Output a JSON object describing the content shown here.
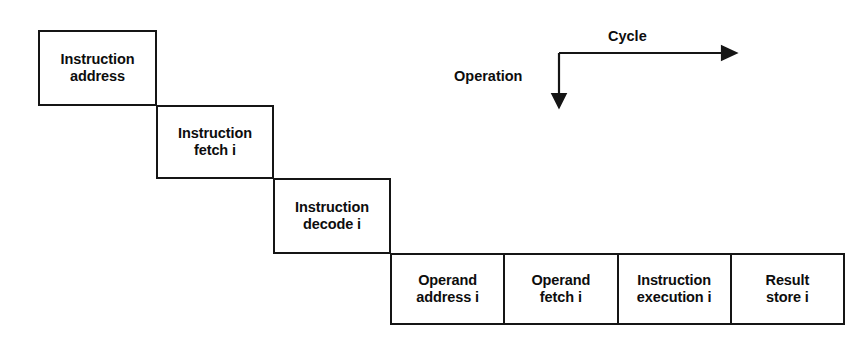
{
  "diagram": {
    "background_color": "#ffffff",
    "line_color": "#151515",
    "text_color": "#0d0d0d",
    "stages": [
      {
        "id": "instruction-address",
        "label": "Instruction\naddress"
      },
      {
        "id": "instruction-fetch",
        "label": "Instruction\nfetch i"
      },
      {
        "id": "instruction-decode",
        "label": "Instruction\ndecode i"
      }
    ],
    "row": {
      "cells": [
        {
          "id": "operand-address",
          "label": "Operand\naddress i"
        },
        {
          "id": "operand-fetch",
          "label": "Operand\nfetch i"
        },
        {
          "id": "instruction-execution",
          "label": "Instruction\nexecution i"
        },
        {
          "id": "result-store",
          "label": "Result\nstore i"
        }
      ]
    },
    "legend": {
      "horizontal_axis_label": "Cycle",
      "vertical_axis_label": "Operation",
      "horizontal_arrow_icon": "arrow-right-icon",
      "vertical_arrow_icon": "arrow-down-icon"
    }
  }
}
